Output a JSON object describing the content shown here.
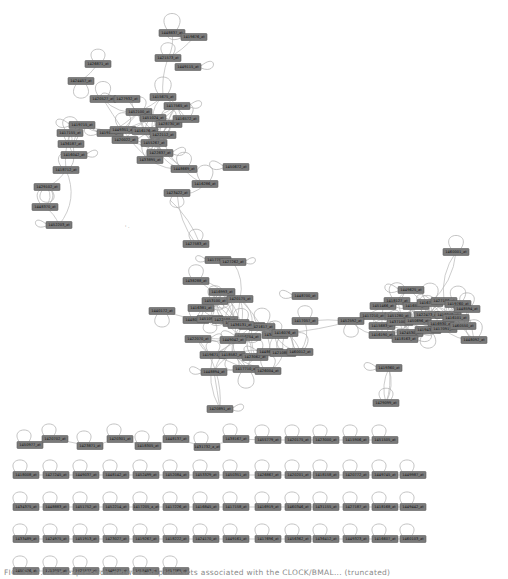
{
  "figure": {
    "type": "gene co-expression network",
    "caption": "FIG. 5.17. A co-expression network of probesets associated with the CLOCK/BMAL... (truncated)"
  },
  "colors": {
    "node_fill": "#7a7a7a",
    "node_border": "#5c5c5c",
    "edge": "#b8b8b8",
    "label": "#111111",
    "background": "#ffffff"
  },
  "clusters": {
    "top": {
      "nodes": [
        "1448837_at",
        "1419676_at",
        "1421573_at",
        "1449115_at",
        "1426871_at",
        "1424457_at",
        "1420527_at",
        "1427932_at",
        "1415675_at",
        "1417565_at",
        "1452100_at",
        "1451024_at",
        "1428730_at",
        "1419181_at",
        "1449351_at",
        "1416176_at",
        "1422112_at",
        "1455267_at",
        "1417155_at",
        "1419715_at",
        "1436187_at",
        "1416042_at",
        "1418712_at",
        "1429102_at",
        "1448370_at",
        "1452203_at",
        "1416572_at",
        "1422837_at",
        "1448669_at",
        "1423422_at",
        "1416286_at",
        "1450672_at",
        "1433895_at",
        "1420022_at"
      ]
    },
    "middle": {
      "nodes": [
        "1427583_at",
        "1417756_at",
        "1427262_at",
        "1438288_at",
        "1416993_at",
        "1453100_at",
        "1420175_at",
        "1416381_at",
        "1448021_at",
        "1451097_at",
        "1422188_at",
        "1448730_at",
        "1419154_at",
        "1421617_at",
        "1440172_at",
        "1436131_at",
        "1416754_at",
        "1449042_at",
        "1434756_at",
        "1416076_at",
        "1417057_at",
        "1448700_at",
        "1422070_at",
        "1419671_at",
        "1418582_at",
        "1423062_at",
        "1448632_at",
        "1421088_at",
        "1460012_at",
        "1417710_at",
        "1426004_at",
        "1448894_at",
        "1420891_at"
      ]
    },
    "right": {
      "nodes": [
        "1460001_at",
        "1449625_at",
        "1418127_at",
        "1451466_at",
        "1416552_at",
        "1416713_at",
        "1427186_at",
        "1419760_at",
        "1417210_at",
        "1451280_at",
        "1422473_at",
        "1418248_at",
        "1448594_at",
        "1415683_at",
        "1437100_at",
        "1450696_at",
        "1416930_at",
        "1416101_at",
        "1424530_at",
        "1419430_at",
        "1417091_at",
        "1460550_at",
        "1416190_at",
        "1418163_at",
        "1452592_at",
        "1448092_at",
        "1419360_at",
        "1429099_at"
      ]
    },
    "pairs": {
      "rows": [
        [
          "1450977_at",
          "1420702_at",
          "1423871_at",
          "1420301_at",
          "1418305_at",
          "1448137_at",
          "1431732_a_at",
          "1438167_at",
          "1455779_at",
          "1420175_at",
          "1423000_at",
          "1415906_at",
          "1451505_at"
        ],
        [
          "1418008_at",
          "1427245_at",
          "1449037_at",
          "1448142_at",
          "1452499_at",
          "1452084_at",
          "1453329_at",
          "1450351_at",
          "1426867_at",
          "1420201_at",
          "1418158_at",
          "1420772_at",
          "1449745_at",
          "1449987_at"
        ],
        [
          "1434375_at",
          "1448883_at",
          "1451752_at",
          "1452214_at",
          "1417205_a_at",
          "1417226_at",
          "1416845_at",
          "1417158_at",
          "1416919_at",
          "1460346_at",
          "1431155_at",
          "1427187_at",
          "1418168_at",
          "1449442_at"
        ],
        [
          "1433489_at",
          "1424975_at",
          "1451913_at",
          "1423027_at",
          "1419267_at",
          "1418222_at",
          "1424170_at",
          "1449161_at",
          "1417696_at",
          "1456362_at",
          "1436412_at",
          "1449323_at",
          "1416607_at",
          "1460103_at"
        ],
        [
          "1450576_at",
          "1417007_at",
          "1421577_at",
          "1449171_at",
          "1455453_at",
          "1417765_at"
        ]
      ]
    }
  }
}
